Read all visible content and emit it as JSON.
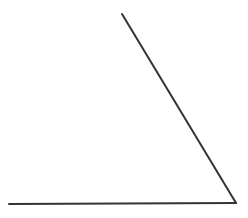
{
  "diagram": {
    "type": "angle",
    "background": "#ffffff",
    "stroke_color": "#333333",
    "stroke_width": 2,
    "vertex": {
      "x": 236,
      "y": 203
    },
    "ray_1_end": {
      "x": 9,
      "y": 204
    },
    "ray_2_end": {
      "x": 122,
      "y": 14
    }
  }
}
